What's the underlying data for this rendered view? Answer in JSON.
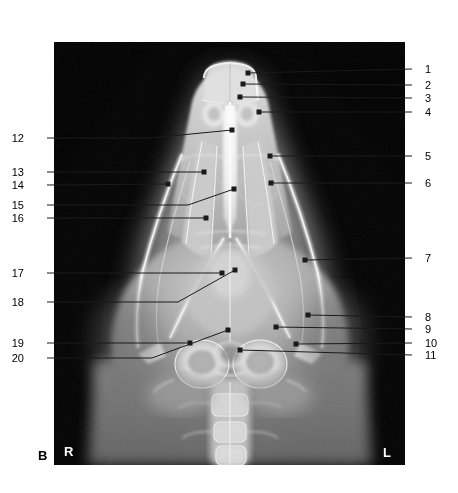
{
  "figure": {
    "panel_label": "B",
    "orientation_markers": [
      {
        "name": "right-marker",
        "text": "R"
      },
      {
        "name": "left-marker",
        "text": "L"
      }
    ],
    "modality": "radiograph",
    "image_bounds": {
      "x": 54,
      "y": 42,
      "width": 351,
      "height": 423
    },
    "colors": {
      "background": "#ffffff",
      "film_black": "#000000",
      "bone_white": "#f4f4f4",
      "leader_line": "#1a1a1a",
      "marker_text": "#ffffff"
    }
  },
  "callouts": {
    "right_column": [
      {
        "id": "1",
        "label": "1",
        "label_x": 425,
        "label_y": 64,
        "elbow_x": 412,
        "elbow_y": 69,
        "tip_x": 248,
        "tip_y": 73
      },
      {
        "id": "2",
        "label": "2",
        "label_x": 425,
        "label_y": 80,
        "elbow_x": 412,
        "elbow_y": 85,
        "tip_x": 243,
        "tip_y": 84
      },
      {
        "id": "3",
        "label": "3",
        "label_x": 425,
        "label_y": 93,
        "elbow_x": 412,
        "elbow_y": 98,
        "tip_x": 240,
        "tip_y": 97
      },
      {
        "id": "4",
        "label": "4",
        "label_x": 425,
        "label_y": 107,
        "elbow_x": 412,
        "elbow_y": 112,
        "tip_x": 259,
        "tip_y": 112
      },
      {
        "id": "5",
        "label": "5",
        "label_x": 425,
        "label_y": 151,
        "elbow_x": 412,
        "elbow_y": 156,
        "tip_x": 270,
        "tip_y": 156
      },
      {
        "id": "6",
        "label": "6",
        "label_x": 425,
        "label_y": 178,
        "elbow_x": 412,
        "elbow_y": 183,
        "tip_x": 271,
        "tip_y": 183
      },
      {
        "id": "7",
        "label": "7",
        "label_x": 425,
        "label_y": 253,
        "elbow_x": 412,
        "elbow_y": 258,
        "tip_x": 305,
        "tip_y": 260
      },
      {
        "id": "8",
        "label": "8",
        "label_x": 425,
        "label_y": 312,
        "elbow_x": 412,
        "elbow_y": 317,
        "tip_x": 308,
        "tip_y": 315
      },
      {
        "id": "9",
        "label": "9",
        "label_x": 425,
        "label_y": 324,
        "elbow_x": 412,
        "elbow_y": 329,
        "tip_x": 276,
        "tip_y": 327
      },
      {
        "id": "10",
        "label": "10",
        "label_x": 425,
        "label_y": 338,
        "elbow_x": 412,
        "elbow_y": 343,
        "tip_x": 296,
        "tip_y": 344
      },
      {
        "id": "11",
        "label": "11",
        "label_x": 425,
        "label_y": 350,
        "elbow_x": 412,
        "elbow_y": 355,
        "tip_x": 240,
        "tip_y": 350
      }
    ],
    "left_column": [
      {
        "id": "12",
        "label": "12",
        "label_x": 24,
        "label_y": 133,
        "elbow_x": 47,
        "elbow_y": 138,
        "tip_x": 232,
        "tip_y": 130,
        "bend_x": 150,
        "bend_y": 138
      },
      {
        "id": "13",
        "label": "13",
        "label_x": 24,
        "label_y": 167,
        "elbow_x": 47,
        "elbow_y": 172,
        "tip_x": 204,
        "tip_y": 172
      },
      {
        "id": "14",
        "label": "14",
        "label_x": 24,
        "label_y": 180,
        "elbow_x": 47,
        "elbow_y": 185,
        "tip_x": 168,
        "tip_y": 184
      },
      {
        "id": "15",
        "label": "15",
        "label_x": 24,
        "label_y": 200,
        "elbow_x": 47,
        "elbow_y": 205,
        "tip_x": 234,
        "tip_y": 189,
        "bend_x": 188,
        "bend_y": 205
      },
      {
        "id": "16",
        "label": "16",
        "label_x": 24,
        "label_y": 213,
        "elbow_x": 47,
        "elbow_y": 218,
        "tip_x": 206,
        "tip_y": 218
      },
      {
        "id": "17",
        "label": "17",
        "label_x": 24,
        "label_y": 268,
        "elbow_x": 47,
        "elbow_y": 273,
        "tip_x": 222,
        "tip_y": 273
      },
      {
        "id": "18",
        "label": "18",
        "label_x": 24,
        "label_y": 297,
        "elbow_x": 47,
        "elbow_y": 302,
        "tip_x": 235,
        "tip_y": 270,
        "bend_x": 178,
        "bend_y": 302
      },
      {
        "id": "19",
        "label": "19",
        "label_x": 24,
        "label_y": 338,
        "elbow_x": 47,
        "elbow_y": 343,
        "tip_x": 190,
        "tip_y": 343
      },
      {
        "id": "20",
        "label": "20",
        "label_x": 24,
        "label_y": 353,
        "elbow_x": 47,
        "elbow_y": 358,
        "tip_x": 228,
        "tip_y": 330,
        "bend_x": 152,
        "bend_y": 358
      }
    ]
  },
  "markers": {
    "panel": {
      "text": "B",
      "x": 38,
      "y": 449
    },
    "right": {
      "text": "R",
      "x": 64,
      "y": 445
    },
    "left": {
      "text": "L",
      "x": 383,
      "y": 446
    }
  }
}
